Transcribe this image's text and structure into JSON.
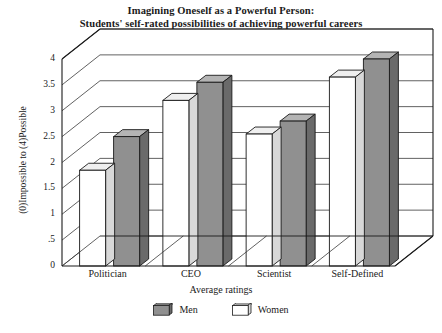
{
  "chart_data": {
    "type": "bar",
    "title": "Imagining Oneself as a Powerful Person:\nStudents' self-rated possibilities of achieving powerful careers",
    "title_line1": "Imagining Oneself as a Powerful Person:",
    "title_line2": "Students' self-rated possibilities of achieving powerful careers",
    "xlabel": "Average ratings",
    "ylabel": "(0)Impossible to (4)Possible",
    "categories": [
      "Politician",
      "CEO",
      "Scientist",
      "Self-Defined"
    ],
    "ylim": [
      0,
      4
    ],
    "yticks": [
      "0",
      ".5",
      "1",
      "1.5",
      "2",
      "2.5",
      "3",
      "3.5",
      "4"
    ],
    "ytick_values": [
      0,
      0.5,
      1,
      1.5,
      2,
      2.5,
      3,
      3.5,
      4
    ],
    "grid": true,
    "legend_position": "bottom",
    "style": "3d-column",
    "series": [
      {
        "name": "Women",
        "values": [
          1.85,
          3.2,
          2.55,
          3.65
        ],
        "fill": "#ffffff",
        "side_fill": "#d8d8d8",
        "top_fill": "#efefef",
        "position": "front"
      },
      {
        "name": "Men",
        "values": [
          2.5,
          3.55,
          2.8,
          4.0
        ],
        "fill": "#909090",
        "side_fill": "#6a6a6a",
        "top_fill": "#b4b4b4",
        "position": "back"
      }
    ]
  },
  "legend": {
    "items": [
      {
        "label": "Men",
        "fill": "#909090"
      },
      {
        "label": "Women",
        "fill": "#ffffff"
      }
    ]
  },
  "colors": {
    "axis": "#1a1a1a",
    "grid": "#555555",
    "background": "#ffffff",
    "men_fill": "#909090",
    "women_fill": "#ffffff"
  }
}
